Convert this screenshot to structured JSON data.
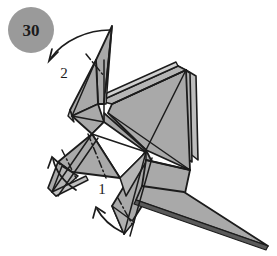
{
  "figure": {
    "type": "origami-step-diagram",
    "background_color": "#ffffff",
    "paper_front_color": "#a9a9a9",
    "paper_back_color": "#c9c9c9",
    "paper_white_color": "#ffffff",
    "edge_color": "#1c1c1c",
    "crease_color": "#2a2a2a",
    "arrow_color": "#1c1c1c"
  },
  "step_badge": {
    "number": "30",
    "shape": "circle",
    "fill_color": "#9a9a9a",
    "center_x": 31,
    "center_y": 30,
    "radius": 23
  },
  "labels": [
    {
      "name": "fold-label-2",
      "text": "2",
      "x": 64,
      "y": 78
    },
    {
      "name": "fold-label-1",
      "text": "1",
      "x": 102,
      "y": 194
    }
  ],
  "arrows": [
    {
      "name": "fold-arrow-2",
      "label": "2",
      "description": "curved arrow from head tip curving down-left",
      "from_x": 112,
      "from_y": 30,
      "to_x": 48,
      "to_y": 62
    },
    {
      "name": "fold-arrow-1-left",
      "label": "1",
      "description": "curved arrow at left foot pointing up-left",
      "from_x": 75,
      "from_y": 188,
      "to_x": 52,
      "to_y": 160
    },
    {
      "name": "fold-arrow-1-lower",
      "label": "1",
      "description": "curved arrow at lower point pointing up-left",
      "from_x": 120,
      "from_y": 232,
      "to_x": 96,
      "to_y": 210
    }
  ],
  "creases": [
    {
      "name": "crease-neck",
      "style": "dash-dot",
      "x1": 88,
      "y1": 55,
      "x2": 102,
      "y2": 75
    },
    {
      "name": "crease-body",
      "style": "dash-dot",
      "x1": 90,
      "y1": 135,
      "x2": 105,
      "y2": 176
    },
    {
      "name": "crease-leg",
      "style": "dash-dot",
      "x1": 63,
      "y1": 152,
      "x2": 74,
      "y2": 176
    },
    {
      "name": "crease-lower-leg",
      "style": "dash-dot",
      "x1": 120,
      "y1": 200,
      "x2": 130,
      "y2": 222
    }
  ],
  "shapes": {
    "head_spike": "narrow vertical spike at top center",
    "left_flap": "triangular flap left of neck",
    "right_wing": "large layered triangular wing",
    "body": "central quadrilateral mass",
    "left_leg": "thin pointed leg to lower-left",
    "tail": "long thin point to lower-right"
  }
}
